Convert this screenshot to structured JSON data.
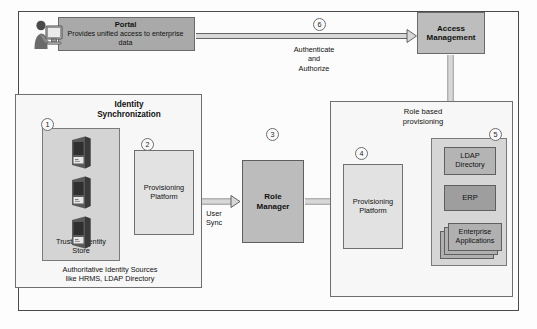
{
  "diagram": {
    "portal": {
      "title": "Portal",
      "description": "Provides unified access to enterprise data",
      "icon": "user-at-computer-icon"
    },
    "access_management": {
      "label": "Access\nManagement",
      "line1": "Access",
      "line2": "Management"
    },
    "flow_labels": {
      "authenticate": "Authenticate",
      "and": "and",
      "authorize": "Authorize",
      "user_sync_line1": "User",
      "user_sync_line2": "Sync"
    },
    "left_panel": {
      "title_line1": "Identity",
      "title_line2": "Synchronization",
      "store_label_line1": "Trusted Identity",
      "store_label_line2": "Store",
      "caption_line1": "Authoritative Identity Sources",
      "caption_line2": "like HRMS, LDAP Directory",
      "server_icon": "server-tower-icon",
      "server_count": 3,
      "provisioning_line1": "Provisioning",
      "provisioning_line2": "Platform"
    },
    "role_manager": {
      "line1": "Role",
      "line2": "Manager"
    },
    "right_panel": {
      "title_line1": "Role based",
      "title_line2": "provisioning",
      "provisioning_line1": "Provisioning",
      "provisioning_line2": "Platform",
      "targets": {
        "ldap_line1": "LDAP",
        "ldap_line2": "Directory",
        "erp": "ERP",
        "apps_line1": "Enterprise",
        "apps_line2": "Applications"
      }
    },
    "step_numbers": {
      "one": "1",
      "two": "2",
      "three": "3",
      "four": "4",
      "five": "5",
      "six": "6"
    },
    "colors": {
      "portal_fill": "#a9a9a9",
      "access_fill": "#bdbdbd",
      "role_fill": "#bcbcbc",
      "provisioning_fill": "#e2e2e2",
      "store_fill": "#d4d4d4",
      "targets_fill": "#d6d6d6",
      "ldap_fill": "#b4b4b4",
      "erp_fill": "#9e9e9e",
      "apps_fill": "#b0b0b0",
      "panel_fill": "#f7f7f7",
      "border": "#6f6f6f",
      "frame_border": "#4a4a4a",
      "arrow_fill": "#d8d8d8",
      "arrow_stroke": "#555555"
    }
  }
}
